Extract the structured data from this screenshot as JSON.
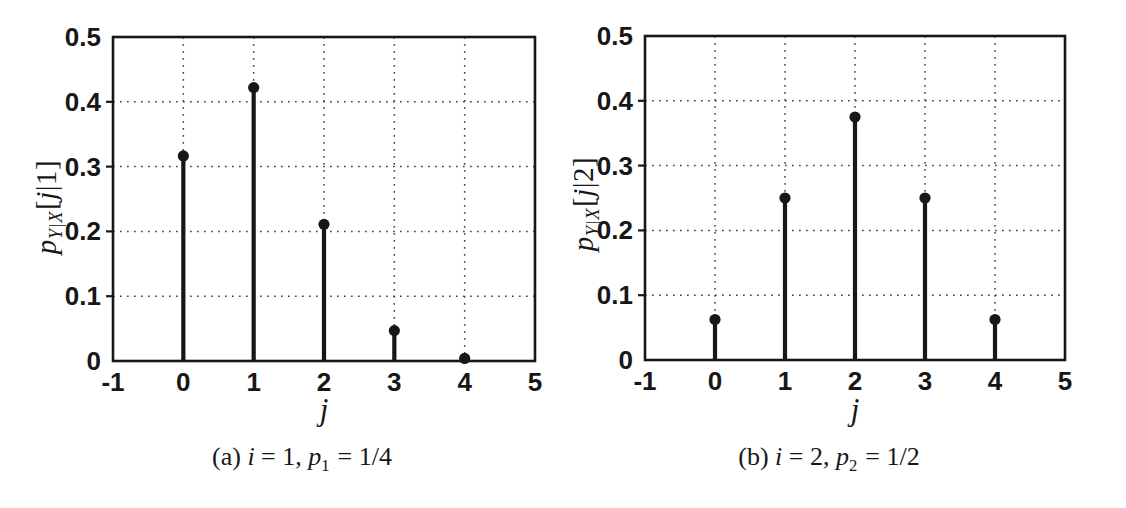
{
  "figure": {
    "background": "#ffffff",
    "ink": "#171717",
    "grid_color": "#474747"
  },
  "chart_data": [
    {
      "type": "stem",
      "panel": "(a)",
      "x": [
        0,
        1,
        2,
        3,
        4
      ],
      "values": [
        0.3164,
        0.4219,
        0.2109,
        0.0469,
        0.0039
      ],
      "xlabel": "j",
      "ylabel": "pY|X[j|1]",
      "caption": "(a) i = 1, p1 = 1/4",
      "xlim": [
        -1,
        5
      ],
      "ylim": [
        0,
        0.5
      ],
      "xtick_values": [
        -1,
        0,
        1,
        2,
        3,
        4,
        5
      ],
      "xtick_labels": [
        "-1",
        "0",
        "1",
        "2",
        "3",
        "4",
        "5"
      ],
      "ytick_values": [
        0,
        0.1,
        0.2,
        0.3,
        0.4,
        0.5
      ],
      "ytick_labels": [
        "0",
        "0.1",
        "0.2",
        "0.3",
        "0.4",
        "0.5"
      ],
      "grid": "dotted",
      "marker": "filled-circle",
      "legend": "none"
    },
    {
      "type": "stem",
      "panel": "(b)",
      "x": [
        0,
        1,
        2,
        3,
        4
      ],
      "values": [
        0.0625,
        0.25,
        0.375,
        0.25,
        0.0625
      ],
      "xlabel": "j",
      "ylabel": "pY|X[j|2]",
      "caption": "(b) i = 2, p2 = 1/2",
      "xlim": [
        -1,
        5
      ],
      "ylim": [
        0,
        0.5
      ],
      "xtick_values": [
        -1,
        0,
        1,
        2,
        3,
        4,
        5
      ],
      "xtick_labels": [
        "-1",
        "0",
        "1",
        "2",
        "3",
        "4",
        "5"
      ],
      "ytick_values": [
        0,
        0.1,
        0.2,
        0.3,
        0.4,
        0.5
      ],
      "ytick_labels": [
        "0",
        "0.1",
        "0.2",
        "0.3",
        "0.4",
        "0.5"
      ],
      "grid": "dotted",
      "marker": "filled-circle",
      "legend": "none"
    }
  ],
  "panels": [
    {
      "ylabel": {
        "var": "p",
        "sub": "Y|X",
        "open": "[",
        "arg": "j",
        "rest": "|1]"
      },
      "xlabel": "j",
      "caption": {
        "tag": "(a)",
        "i_var": "i",
        "i_eq": "= 1,",
        "p_var": "p",
        "p_sub": "1",
        "p_eq": "= 1/4"
      }
    },
    {
      "ylabel": {
        "var": "p",
        "sub": "Y|X",
        "open": "[",
        "arg": "j",
        "rest": "|2]"
      },
      "xlabel": "j",
      "caption": {
        "tag": "(b)",
        "i_var": "i",
        "i_eq": "= 2,",
        "p_var": "p",
        "p_sub": "2",
        "p_eq": "= 1/2"
      }
    }
  ]
}
